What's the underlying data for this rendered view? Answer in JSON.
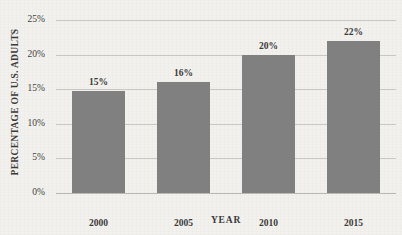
{
  "chart_data": {
    "type": "bar",
    "title": "",
    "xlabel": "YEAR",
    "ylabel": "PERCENTAGE OF U.S. ADULTS",
    "categories": [
      "2000",
      "2005",
      "2010",
      "2015"
    ],
    "values": [
      14.8,
      16.0,
      19.9,
      21.9
    ],
    "data_labels": [
      "15%",
      "16%",
      "20%",
      "22%"
    ],
    "ylim": [
      0,
      25
    ],
    "ytick_values": [
      0,
      5,
      10,
      15,
      20,
      25
    ],
    "ytick_labels": [
      "0%",
      "5%",
      "10%",
      "15%",
      "20%",
      "25%"
    ],
    "grid": true,
    "legend": "none",
    "series": [
      {
        "name": "Percentage of U.S. adults",
        "values": [
          14.8,
          16.0,
          19.9,
          21.9
        ],
        "color": "#808080"
      }
    ]
  },
  "colors": {
    "bar": "#808080",
    "background": "#f2f1ee",
    "gridline": "#c9c7c4",
    "text": "#3a3a3a"
  }
}
